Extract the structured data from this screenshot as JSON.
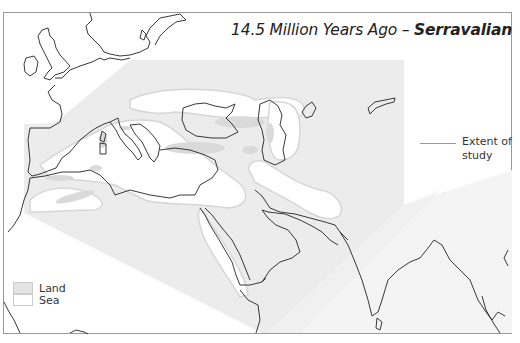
{
  "title": {
    "prefix": "14.5 Million Years Ago – ",
    "stage": "Serravalian"
  },
  "annotation": {
    "extent_label_line1": "Extent of",
    "extent_label_line2": "study"
  },
  "legend": {
    "items": [
      {
        "label": "Land",
        "color": "#e4e4e4"
      },
      {
        "label": "Sea",
        "color": "#ffffff"
      }
    ]
  },
  "colors": {
    "study_area": "#ececec",
    "paleo_land": "#dadada",
    "sea": "#ffffff",
    "coastline": "#222222",
    "frame": "#999999"
  }
}
